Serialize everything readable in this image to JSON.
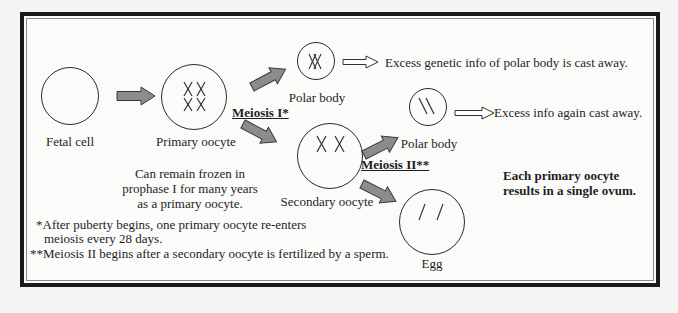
{
  "diagram": {
    "colors": {
      "frame_border": "#1a1a1a",
      "frame_inner_line": "#8a8a8a",
      "arrow_fill": "#8c8c8c",
      "arrow_stroke": "#3a3a3a",
      "background": "#fbfbfa"
    },
    "cells": {
      "fetal_cell": {
        "label": "Fetal cell",
        "chromosomes": "none"
      },
      "primary_oocyte": {
        "label": "Primary oocyte",
        "chromosomes": "XX XX (two pairs of X)"
      },
      "polar_body_1": {
        "label": "Polar body",
        "chromosomes": "overlapping XX"
      },
      "secondary_oocyte": {
        "label": "Secondary oocyte",
        "chromosomes": "X X"
      },
      "polar_body_2": {
        "label": "Polar body",
        "chromosomes": "\\ \\"
      },
      "egg": {
        "label": "Egg",
        "chromosomes": "/ /"
      }
    },
    "stages": {
      "meiosis_1": "Meiosis I*",
      "meiosis_2": "Meiosis II**"
    },
    "annotations": {
      "polar_body_1_fate": "Excess genetic info of polar body is cast away.",
      "polar_body_2_fate": "Excess info again cast away.",
      "frozen_note": [
        "Can remain frozen in",
        "prophase I for many years",
        "as a primary oocyte."
      ],
      "summary": [
        "Each primary oocyte",
        "results in a single ovum."
      ]
    },
    "footnotes": {
      "note_1_line_1": "*After puberty begins, one primary oocyte re-enters",
      "note_1_line_2": "meiosis every 28 days.",
      "note_2": "**Meiosis II begins after a secondary oocyte is fertilized by a sperm."
    }
  }
}
